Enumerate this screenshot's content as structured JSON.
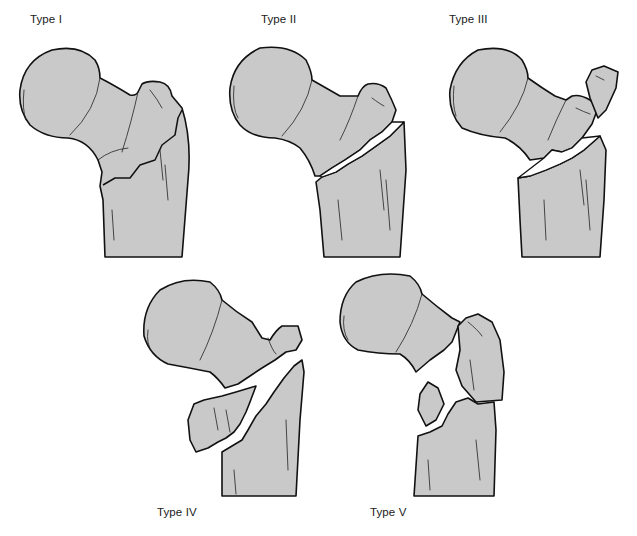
{
  "figure": {
    "panels": [
      {
        "id": "type-1",
        "label": "Type I"
      },
      {
        "id": "type-2",
        "label": "Type II"
      },
      {
        "id": "type-3",
        "label": "Type III"
      },
      {
        "id": "type-4",
        "label": "Type IV"
      },
      {
        "id": "type-5",
        "label": "Type V"
      }
    ]
  },
  "colors": {
    "bone_fill": "#c9c9c9",
    "outline": "#111111",
    "background": "#ffffff"
  }
}
